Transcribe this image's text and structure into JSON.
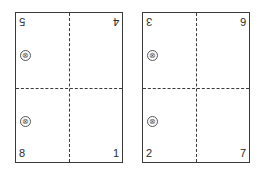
{
  "diagram": {
    "sheets": [
      {
        "id": "left",
        "top_left": "5",
        "top_right": "4",
        "bottom_left": "8",
        "bottom_right": "1",
        "marks": [
          "⊗",
          "⊗"
        ]
      },
      {
        "id": "right",
        "top_left": "3",
        "top_right": "6",
        "bottom_left": "2",
        "bottom_right": "7",
        "marks": [
          "⊗",
          "⊗"
        ]
      }
    ],
    "notes": {
      "top_row_orientation": "upside-down",
      "fold_lines": "dashed"
    }
  }
}
